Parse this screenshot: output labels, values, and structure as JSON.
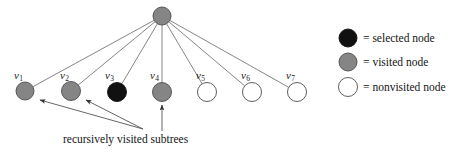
{
  "figure": {
    "colors": {
      "selected": "#111111",
      "visited": "#858585",
      "nonvisited": "#ffffff",
      "stroke": "#555555",
      "node_stroke": "#4d4d4d",
      "text": "#141414",
      "background": "#ffffff"
    }
  },
  "tree": {
    "root": {
      "name": "root-node",
      "state": "visited",
      "cx": 162,
      "cy": 16,
      "r": 9
    },
    "children": [
      {
        "label_v": "v",
        "label_sub": "1",
        "state": "visited",
        "cx": 25,
        "cy": 91,
        "r": 9,
        "label_x": 14,
        "label_y": 70
      },
      {
        "label_v": "v",
        "label_sub": "2",
        "state": "visited",
        "cx": 71,
        "cy": 91,
        "r": 9.5,
        "label_x": 60,
        "label_y": 70
      },
      {
        "label_v": "v",
        "label_sub": "3",
        "state": "selected",
        "cx": 117,
        "cy": 92,
        "r": 9.5,
        "label_x": 105,
        "label_y": 70
      },
      {
        "label_v": "v",
        "label_sub": "4",
        "state": "visited",
        "cx": 162,
        "cy": 92,
        "r": 9.5,
        "label_x": 150,
        "label_y": 70
      },
      {
        "label_v": "v",
        "label_sub": "5",
        "state": "nonvisited",
        "cx": 207,
        "cy": 92,
        "r": 9.5,
        "label_x": 196,
        "label_y": 70
      },
      {
        "label_v": "v",
        "label_sub": "6",
        "state": "nonvisited",
        "cx": 252,
        "cy": 92,
        "r": 9.5,
        "label_x": 241,
        "label_y": 70
      },
      {
        "label_v": "v",
        "label_sub": "7",
        "state": "nonvisited",
        "cx": 297,
        "cy": 92,
        "r": 9.5,
        "label_x": 286,
        "label_y": 70
      }
    ]
  },
  "annotation": {
    "caption": "recursively visited subtrees",
    "caption_x": 63,
    "caption_y": 134,
    "arrows": [
      {
        "name": "arrow-to-v1",
        "from_x": 143,
        "from_y": 129,
        "to_x": 40,
        "to_y": 100
      },
      {
        "name": "arrow-to-v2",
        "from_x": 143,
        "from_y": 129,
        "to_x": 86,
        "to_y": 100
      },
      {
        "name": "arrow-to-v4",
        "from_x": 162,
        "from_y": 131,
        "to_x": 162,
        "to_y": 105
      }
    ]
  },
  "legend": {
    "items": [
      {
        "swatch": "selected",
        "equals": "=",
        "label": "selected node",
        "cx": 348,
        "cy": 38,
        "r": 9,
        "text_x": 363,
        "text_y": 33
      },
      {
        "swatch": "visited",
        "equals": "=",
        "label": "visited node",
        "cx": 348,
        "cy": 62,
        "r": 9,
        "text_x": 363,
        "text_y": 57
      },
      {
        "swatch": "nonvisited",
        "equals": "=",
        "label": "nonvisited node",
        "cx": 348,
        "cy": 87,
        "r": 9.5,
        "text_x": 363,
        "text_y": 82
      }
    ]
  }
}
